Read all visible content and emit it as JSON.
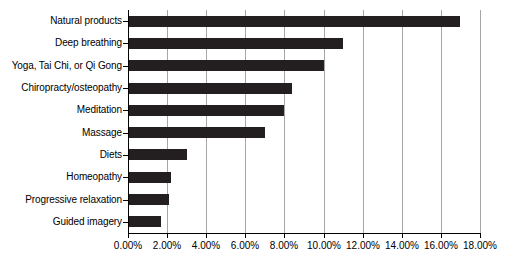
{
  "chart_data": {
    "type": "bar",
    "orientation": "horizontal",
    "title": "",
    "subtitle": "",
    "xlabel": "",
    "ylabel": "",
    "categories": [
      "Natural products",
      "Deep breathing",
      "Yoga, Tai Chi, or Qi Gong",
      "Chiropracty/osteopathy",
      "Meditation",
      "Massage",
      "Diets",
      "Homeopathy",
      "Progressive relaxation",
      "Guided imagery"
    ],
    "values": [
      17.0,
      11.0,
      10.0,
      8.4,
      8.0,
      7.0,
      3.0,
      2.2,
      2.1,
      1.7
    ],
    "value_labels": [
      "17.00%",
      "11.00%",
      "10.00%",
      "8.40%",
      "8.00%",
      "7.00%",
      "3.00%",
      "2.20%",
      "2.10%",
      "1.70%"
    ],
    "xlim": [
      0,
      18
    ],
    "xticks": [
      0,
      2,
      4,
      6,
      8,
      10,
      12,
      14,
      16,
      18
    ],
    "xtick_labels": [
      "0.00%",
      "2.00%",
      "4.00%",
      "6.00%",
      "8.00%",
      "10.00%",
      "12.00%",
      "14.00%",
      "16.00%",
      "18.00%"
    ],
    "grid": "vertical",
    "legend": null,
    "bar_color": "#231f20",
    "gridline_color": "#a6a6a6",
    "axis_color": "#000000",
    "background_color": "#ffffff"
  }
}
